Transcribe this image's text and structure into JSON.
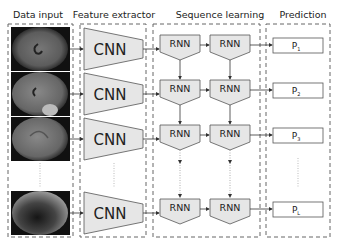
{
  "headers": {
    "data_input": "Data input",
    "feature_extractor": "Feature extractor",
    "sequence_learning": "Sequence learning",
    "prediction": "Prediction"
  },
  "cnn_label": "CNN",
  "rnn_label": "RNN",
  "predictions": [
    {
      "base": "P",
      "sub": "1"
    },
    {
      "base": "P",
      "sub": "2"
    },
    {
      "base": "P",
      "sub": "3"
    },
    {
      "base": "P",
      "sub": "L"
    }
  ],
  "colors": {
    "block_fill": "#e6e6e6",
    "stroke": "#555555",
    "dash": "#666666",
    "background": "#ffffff"
  }
}
